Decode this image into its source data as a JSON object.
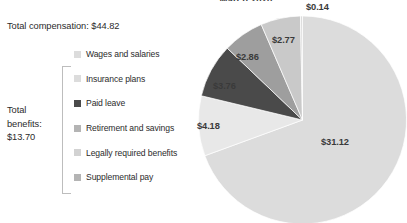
{
  "chart_data": {
    "type": "pie",
    "title": "March 2020",
    "unit": "dollars per hour worked",
    "categories": [
      "Wages and salaries",
      "Insurance plans",
      "Paid leave",
      "Retirement and savings",
      "Legally required benefits",
      "Supplemental pay"
    ],
    "values": [
      31.12,
      3.76,
      2.86,
      2.77,
      4.18,
      0.14
    ],
    "value_labels": [
      "$31.12",
      "$3.76",
      "$2.86",
      "$2.77",
      "$4.18",
      "$0.14"
    ],
    "colors": [
      "#dcdcdc",
      "#4a4a4a",
      "#9e9e9e",
      "#c9c9c9",
      "#e8e8e8",
      "#dcdcdc"
    ],
    "legend_position": "left",
    "grid": false,
    "xlabel": "",
    "ylabel": ""
  },
  "summary": {
    "total_compensation_label": "Total compensation: $44.82",
    "total_benefits_label": "Total benefits: $13.70",
    "total_benefits_line1": "Total",
    "total_benefits_line2": "benefits:",
    "total_benefits_line3": "$13.70"
  },
  "legend": {
    "items": [
      {
        "label": "Wages and salaries",
        "color": "#dcdcdc"
      },
      {
        "label": "Insurance plans",
        "color": "#dcdcdc"
      },
      {
        "label": "Paid leave",
        "color": "#4a4a4a"
      },
      {
        "label": "Retirement and savings",
        "color": "#b4b4b4"
      },
      {
        "label": "Legally required benefits",
        "color": "#d2d2d2"
      },
      {
        "label": "Supplemental pay",
        "color": "#b4b4b4"
      }
    ]
  },
  "pie_labels": [
    {
      "text": "$0.14",
      "left": 108,
      "top": -6
    },
    {
      "text": "$2.77",
      "left": 74,
      "top": 27
    },
    {
      "text": "$2.86",
      "left": 38,
      "top": 44
    },
    {
      "text": "$3.76",
      "left": 15,
      "top": 73
    },
    {
      "text": "$4.18",
      "left": -1,
      "top": 113
    },
    {
      "text": "$31.12",
      "left": 123,
      "top": 129
    }
  ]
}
